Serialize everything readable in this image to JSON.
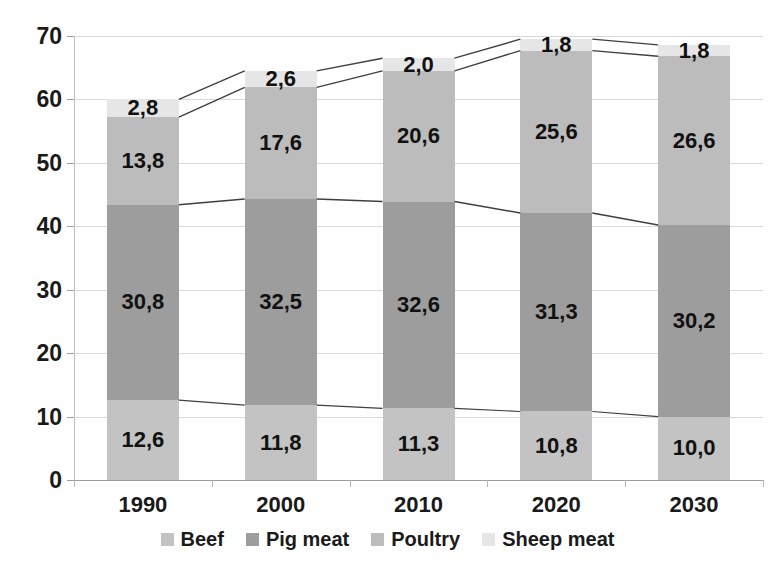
{
  "chart_data": {
    "type": "bar",
    "subtype": "stacked-bar-with-series-connectors",
    "title": "",
    "subtitle": "",
    "xlabel": "",
    "ylabel": "",
    "categories": [
      "1990",
      "2000",
      "2010",
      "2020",
      "2030"
    ],
    "series": [
      {
        "name": "Beef",
        "color": "#c3c3c3",
        "values": [
          12.6,
          11.8,
          11.3,
          10.8,
          10.0
        ],
        "labels": [
          "12,6",
          "11,8",
          "11,3",
          "10,8",
          "10,0"
        ]
      },
      {
        "name": "Pig meat",
        "color": "#9d9d9d",
        "values": [
          30.8,
          32.5,
          32.6,
          31.3,
          30.2
        ],
        "labels": [
          "30,8",
          "32,5",
          "32,6",
          "31,3",
          "30,2"
        ]
      },
      {
        "name": "Poultry",
        "color": "#bcbcbc",
        "values": [
          13.8,
          17.6,
          20.6,
          25.6,
          26.6
        ],
        "labels": [
          "13,8",
          "17,6",
          "20,6",
          "25,6",
          "26,6"
        ]
      },
      {
        "name": "Sheep meat",
        "color": "#e6e6e6",
        "values": [
          2.8,
          2.6,
          2.0,
          1.8,
          1.8
        ],
        "labels": [
          "2,8",
          "2,6",
          "2,0",
          "1,8",
          "1,8"
        ]
      }
    ],
    "totals": [
      60.0,
      64.5,
      66.5,
      69.5,
      68.6
    ],
    "ylim": [
      0,
      70
    ],
    "yticks": [
      0,
      10,
      20,
      30,
      40,
      50,
      60,
      70
    ],
    "ytick_labels": [
      "0",
      "10",
      "20",
      "30",
      "40",
      "50",
      "60",
      "70"
    ],
    "grid": true,
    "legend_position": "bottom",
    "decimal_separator": ","
  },
  "legend": {
    "items": [
      {
        "label": "Beef",
        "color": "#c3c3c3"
      },
      {
        "label": "Pig meat",
        "color": "#9d9d9d"
      },
      {
        "label": "Poultry",
        "color": "#bcbcbc"
      },
      {
        "label": "Sheep meat",
        "color": "#e6e6e6"
      }
    ]
  },
  "axes": {
    "y_tick_labels": [
      "70",
      "60",
      "50",
      "40",
      "30",
      "20",
      "10",
      "0"
    ],
    "x_tick_labels": [
      "1990",
      "2000",
      "2010",
      "2020",
      "2030"
    ]
  },
  "colors": {
    "background": "#ffffff",
    "gridline": "#d9d9d9",
    "axis": "#9d9d9d",
    "connector": "#3f3f3f",
    "text": "#1a1a1a"
  }
}
